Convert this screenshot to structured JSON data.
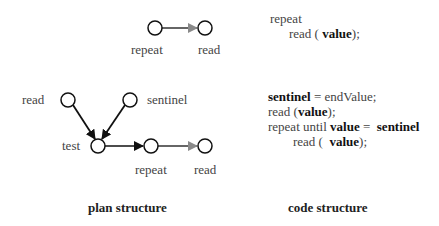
{
  "top_plan": {
    "nodes": [
      {
        "id": "repeat",
        "label": "repeat"
      },
      {
        "id": "read",
        "label": "read"
      }
    ]
  },
  "bottom_plan": {
    "nodes": [
      {
        "id": "read",
        "label": "read"
      },
      {
        "id": "sentinel",
        "label": "sentinel"
      },
      {
        "id": "test",
        "label": "test"
      },
      {
        "id": "repeat",
        "label": "repeat"
      },
      {
        "id": "read2",
        "label": "read"
      }
    ]
  },
  "top_code": {
    "line1": "repeat",
    "line2_pre": "read ( ",
    "line2_bold": "value",
    "line2_post": ");"
  },
  "bottom_code": {
    "l1_bold": "sentinel",
    "l1_post": " = endValue;",
    "l2_pre": "read (",
    "l2_bold": "value",
    "l2_post": ");",
    "l3_pre": "repeat until ",
    "l3_bold1": "value",
    "l3_mid": " =  ",
    "l3_bold2": "sentinel",
    "l4_pre": "read (  ",
    "l4_bold": "value",
    "l4_post": ");"
  },
  "captions": {
    "plan": "plan structure",
    "code": "code structure"
  },
  "colors": {
    "node_stroke": "#111111",
    "arrow_black": "#111111",
    "arrow_gray": "#8a8a8a"
  }
}
